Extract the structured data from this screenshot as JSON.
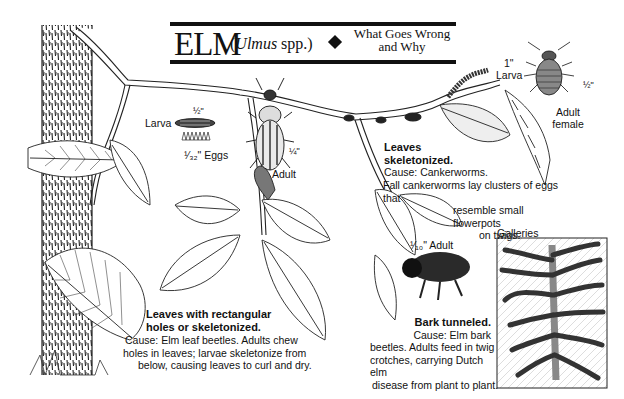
{
  "title": {
    "main": "ELM",
    "latin_open": "(",
    "latin_genus": "Ulmus",
    "latin_rest": " spp.)",
    "separator_icon": "diamond",
    "subtitle_line1": "What Goes Wrong",
    "subtitle_line2": "and Why"
  },
  "elm_leaf_beetle": {
    "larva_label": "Larva",
    "larva_size": "½\"",
    "eggs_label": "¹⁄₃₂\" Eggs",
    "adult_label": "Adult",
    "adult_size": "¼\"",
    "caption_heading_1": "Leaves with rectangular",
    "caption_heading_2": "holes or skeletonized.",
    "caption_line1": "Cause: Elm leaf beetles. Adults chew",
    "caption_line2": "holes in leaves; larvae skeletonize from",
    "caption_line3": "below, causing leaves to curl and dry."
  },
  "cankerworm": {
    "larva_size": "1\"",
    "larva_label": "Larva",
    "adult_size": "½\"",
    "adult_label_1": "Adult",
    "adult_label_2": "female",
    "caption_heading_1": "Leaves",
    "caption_heading_2": "skeletonized.",
    "caption_line1": "Cause: Cankerworms.",
    "caption_line2": "Fall cankerworms lay clusters of eggs that",
    "caption_line3": "resemble small flowerpots",
    "caption_line4": "on twigs."
  },
  "bark_beetle": {
    "adult_label": "¹⁄₁₀\" Adult",
    "galleries_label": "Galleries",
    "caption_heading": "Bark tunneled.",
    "caption_line1": "Cause: Elm bark",
    "caption_line2": "beetles. Adults feed in twig",
    "caption_line3": "crotches, carrying Dutch elm",
    "caption_line4": "disease from plant to plant."
  },
  "colors": {
    "ink": "#111111",
    "paper": "#ffffff",
    "bark_shade": "#555555"
  }
}
